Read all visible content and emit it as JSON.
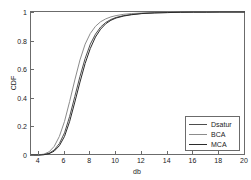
{
  "chart_data": {
    "type": "line",
    "title": "",
    "xlabel": "db",
    "ylabel": "CDF",
    "xlim": [
      3.4,
      20
    ],
    "ylim": [
      0,
      1
    ],
    "grid": false,
    "legend_position": "lower-right",
    "xticks": [
      4,
      6,
      8,
      10,
      12,
      14,
      16,
      18,
      20
    ],
    "xticklabels": [
      "4",
      "6",
      "8",
      "10",
      "12",
      "14",
      "16",
      "18",
      "20"
    ],
    "yticks": [
      0,
      0.2,
      0.4,
      0.6,
      0.8,
      1
    ],
    "yticklabels": [
      "0",
      "0.2",
      "0.4",
      "0.6",
      "0.8",
      "1"
    ],
    "series": [
      {
        "name": "Dsatur",
        "color": "#4d4d4d",
        "x": [
          3.4,
          4.0,
          4.4,
          4.8,
          5.2,
          5.6,
          6.0,
          6.4,
          6.8,
          7.2,
          7.6,
          8.0,
          8.4,
          8.8,
          9.2,
          9.6,
          10.0,
          10.6,
          11.2,
          12.0,
          13.0,
          14.0,
          15.0,
          16.0,
          17.0,
          18.0,
          20.0
        ],
        "y": [
          0.0,
          0.0,
          0.003,
          0.012,
          0.035,
          0.08,
          0.155,
          0.27,
          0.41,
          0.55,
          0.675,
          0.775,
          0.845,
          0.895,
          0.927,
          0.948,
          0.962,
          0.975,
          0.983,
          0.99,
          0.994,
          0.996,
          0.998,
          0.999,
          0.999,
          1.0,
          1.0
        ]
      },
      {
        "name": "BCA",
        "color": "#8c8c8c",
        "x": [
          3.4,
          4.0,
          4.4,
          4.8,
          5.2,
          5.6,
          6.0,
          6.4,
          6.8,
          7.2,
          7.6,
          8.0,
          8.4,
          8.8,
          9.2,
          9.6,
          10.0,
          10.6,
          11.2,
          12.0,
          13.0,
          14.0,
          15.0,
          16.0,
          17.0,
          18.0,
          20.0
        ],
        "y": [
          0.0,
          0.001,
          0.006,
          0.022,
          0.06,
          0.13,
          0.235,
          0.375,
          0.525,
          0.665,
          0.775,
          0.85,
          0.9,
          0.932,
          0.952,
          0.966,
          0.975,
          0.984,
          0.989,
          0.993,
          0.996,
          0.998,
          0.999,
          0.999,
          1.0,
          1.0,
          1.0
        ]
      },
      {
        "name": "MCA",
        "color": "#2b2b2b",
        "x": [
          3.4,
          4.0,
          4.4,
          4.8,
          5.2,
          5.6,
          6.0,
          6.4,
          6.8,
          7.2,
          7.6,
          8.0,
          8.4,
          8.8,
          9.2,
          9.6,
          10.0,
          10.6,
          11.2,
          12.0,
          13.0,
          14.0,
          15.0,
          16.0,
          17.0,
          18.0,
          20.0
        ],
        "y": [
          0.0,
          0.0,
          0.002,
          0.009,
          0.027,
          0.065,
          0.13,
          0.235,
          0.37,
          0.51,
          0.64,
          0.745,
          0.825,
          0.88,
          0.918,
          0.942,
          0.958,
          0.972,
          0.981,
          0.989,
          0.994,
          0.996,
          0.998,
          0.999,
          0.999,
          1.0,
          1.0
        ]
      }
    ]
  },
  "legend": {
    "entries": [
      {
        "label": "Dsatur"
      },
      {
        "label": "BCA"
      },
      {
        "label": "MCA"
      }
    ]
  }
}
